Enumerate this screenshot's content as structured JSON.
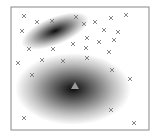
{
  "diagram": {
    "frame": {
      "x": 11,
      "y": 7,
      "width": 138,
      "height": 123,
      "stroke": "#888888"
    },
    "clusters": [
      {
        "name": "upper-cluster",
        "cx": 55,
        "cy": 31,
        "rx": 36,
        "ry": 14,
        "rotate": -22,
        "color": "#000000"
      },
      {
        "name": "lower-cluster",
        "cx": 73,
        "cy": 89,
        "rx": 58,
        "ry": 36,
        "rotate": 0,
        "color": "#000000"
      }
    ],
    "centroid": {
      "x": 75,
      "y": 86,
      "shape": "triangle",
      "color": "#999999"
    },
    "points": [
      [
        24,
        16
      ],
      [
        37,
        22
      ],
      [
        52,
        21
      ],
      [
        22,
        31
      ],
      [
        76,
        17
      ],
      [
        84,
        24
      ],
      [
        95,
        22
      ],
      [
        111,
        18
      ],
      [
        126,
        15
      ],
      [
        104,
        30
      ],
      [
        118,
        32
      ],
      [
        87,
        38
      ],
      [
        99,
        42
      ],
      [
        114,
        40
      ],
      [
        29,
        49
      ],
      [
        53,
        49
      ],
      [
        73,
        44
      ],
      [
        86,
        48
      ],
      [
        109,
        52
      ],
      [
        18,
        63
      ],
      [
        42,
        60
      ],
      [
        63,
        61
      ],
      [
        87,
        58
      ],
      [
        32,
        75
      ],
      [
        112,
        70
      ],
      [
        130,
        79
      ],
      [
        111,
        110
      ],
      [
        24,
        118
      ],
      [
        134,
        123
      ]
    ],
    "point_marker": "x-icon",
    "point_color": "#777777"
  }
}
